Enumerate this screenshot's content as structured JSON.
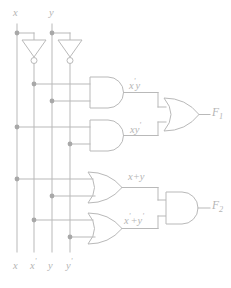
{
  "diagram": {
    "type": "logic-circuit",
    "colors": {
      "line": "#b9b9b9",
      "junction": "#a8a8a8",
      "text": "#b5b5b5",
      "background": "#ffffff"
    }
  },
  "inputs_top": [
    {
      "id": "x",
      "label": "x",
      "x": 17
    },
    {
      "id": "y",
      "label": "y",
      "x": 52
    }
  ],
  "rails_bottom": [
    {
      "id": "x",
      "base": "x",
      "prime": "",
      "x": 17
    },
    {
      "id": "x-prime",
      "base": "x",
      "prime": "'",
      "x": 34
    },
    {
      "id": "y",
      "base": "y",
      "prime": "",
      "x": 52
    },
    {
      "id": "y-prime",
      "base": "y",
      "prime": "'",
      "x": 70
    }
  ],
  "inverters": [
    {
      "id": "inv-x",
      "input": "x",
      "output": "x'"
    },
    {
      "id": "inv-y",
      "input": "y",
      "output": "y'"
    }
  ],
  "gates": [
    {
      "id": "and-1",
      "kind": "AND",
      "inputs": [
        "x'",
        "y"
      ],
      "output_label_base": "x",
      "output_label_prime": "'",
      "output_label_tail": "y",
      "expr": "x'y"
    },
    {
      "id": "and-2",
      "kind": "AND",
      "inputs": [
        "x",
        "y'"
      ],
      "output_label_base": "x",
      "output_label_prime": "",
      "output_label_tail": "y'",
      "expr": "xy'"
    },
    {
      "id": "or-1",
      "kind": "OR",
      "inputs": [
        "x",
        "y"
      ],
      "expr": "x+y"
    },
    {
      "id": "or-2",
      "kind": "OR",
      "inputs": [
        "x'",
        "y'"
      ],
      "expr": "x'+y'"
    },
    {
      "id": "or-out",
      "kind": "OR",
      "inputs": [
        "x'y",
        "xy'"
      ],
      "expr": "F1"
    },
    {
      "id": "and-out",
      "kind": "AND",
      "inputs": [
        "x+y",
        "x'+y'"
      ],
      "expr": "F2"
    }
  ],
  "expr_labels": {
    "and1": {
      "base": "x",
      "prime": "'",
      "tail": "y"
    },
    "and2": {
      "base": "x",
      "tail": "y",
      "prime": "'"
    },
    "or1": {
      "text": "x+y"
    },
    "or2": {
      "left_base": "x",
      "left_prime": "'",
      "plus": "+",
      "right_base": "y",
      "right_prime": "'"
    }
  },
  "outputs": [
    {
      "id": "F1",
      "base": "F",
      "sub": "1"
    },
    {
      "id": "F2",
      "base": "F",
      "sub": "2"
    }
  ]
}
